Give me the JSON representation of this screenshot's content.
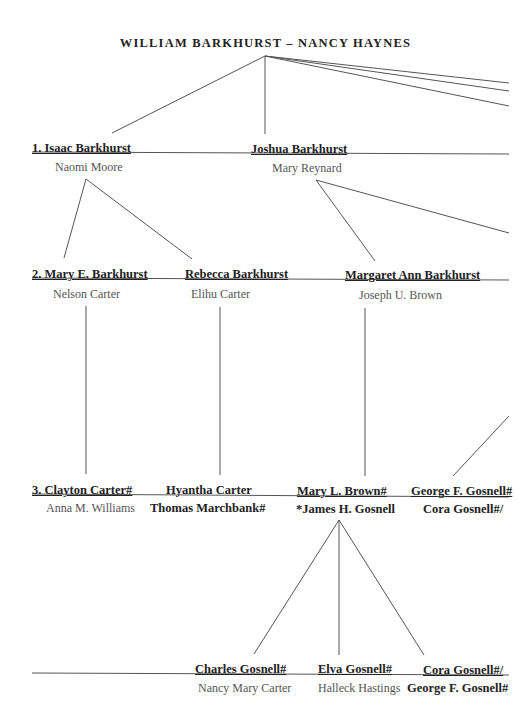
{
  "title": "WILLIAM BARKHURST – NANCY HAYNES",
  "generation1": {
    "persons": [
      {
        "name": "1. Isaac Barkhurst",
        "spouse": "Naomi Moore"
      },
      {
        "name": "Joshua Barkhurst",
        "spouse": "Mary Reynard"
      }
    ]
  },
  "generation2": {
    "persons": [
      {
        "name": "2. Mary E. Barkhurst",
        "spouse": "Nelson Carter"
      },
      {
        "name": "Rebecca Barkhurst",
        "spouse": "Elihu Carter"
      },
      {
        "name": "Margaret Ann Barkhurst",
        "spouse": "Joseph U. Brown"
      }
    ]
  },
  "generation3": {
    "persons": [
      {
        "name": "3. Clayton Carter#",
        "spouse": "Anna M. Williams"
      },
      {
        "name": "Hyantha Carter",
        "spouse": "Thomas Marchbank#"
      },
      {
        "name": "Mary L. Brown#",
        "spouse": "*James H. Gosnell"
      },
      {
        "name": "George F. Gosnell#",
        "spouse": "Cora Gosnell#/"
      }
    ]
  },
  "generation4": {
    "persons": [
      {
        "name": "Charles Gosnell#",
        "spouse": "Nancy Mary Carter"
      },
      {
        "name": "Elva Gosnell#",
        "spouse": "Halleck Hastings"
      },
      {
        "name": "Cora Gosnell#/",
        "spouse": "George F. Gosnell#"
      }
    ]
  },
  "colors": {
    "line": "#555555",
    "text": "#222222",
    "spouse_text": "#555555",
    "background": "#ffffff"
  }
}
